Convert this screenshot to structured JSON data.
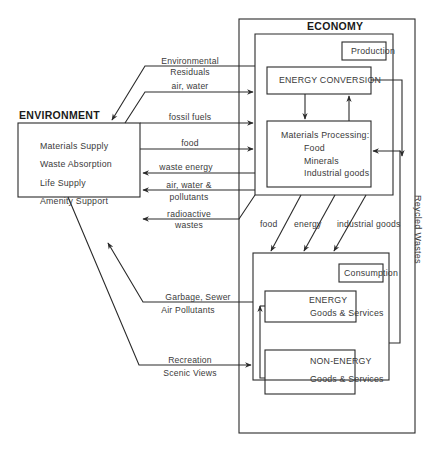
{
  "environment": {
    "title": "ENVIRONMENT",
    "functions": [
      "Materials Supply",
      "Waste Absorption",
      "Life Supply",
      "Amenity Support"
    ]
  },
  "economy": {
    "title": "ECONOMY",
    "production": {
      "label": "Production",
      "energy_conversion": "ENERGY CONVERSION",
      "materials_processing": {
        "title": "Materials Processing:",
        "items": [
          "Food",
          "Minerals",
          "Industrial goods"
        ]
      }
    },
    "consumption": {
      "label": "Consumption",
      "energy_box": {
        "line1": "ENERGY",
        "line2": "Goods & Services"
      },
      "nonenergy_box": {
        "line1": "NON-ENERGY",
        "line2": "Goods & Services"
      }
    },
    "recycled_label": "Reycled Wastes"
  },
  "flows": {
    "env_residuals": [
      "Environmental",
      "Residuals"
    ],
    "air_water": "air, water",
    "fossil_fuels": "fossil fuels",
    "food_in": "food",
    "waste_energy": "waste energy",
    "air_water_pollutants": [
      "air, water &",
      "pollutants"
    ],
    "radioactive": [
      "radioactive",
      "wastes"
    ],
    "prod_to_cons": [
      "food",
      "energy",
      "industrial goods"
    ],
    "garbage": [
      "Garbage, Sewer",
      "Air Pollutants"
    ],
    "recreation": [
      "Recreation",
      "Scenic Views"
    ]
  },
  "colors": {
    "line": "#2a2a2a",
    "text": "#3a3a3a",
    "background": "#ffffff"
  }
}
